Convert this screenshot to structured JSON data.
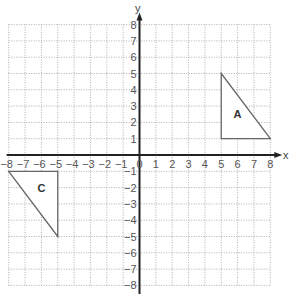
{
  "diagram": {
    "type": "coordinate-plane",
    "x_axis": {
      "label": "x",
      "min": -8,
      "max": 8,
      "ticks": [
        -8,
        -7,
        -6,
        -5,
        -4,
        -3,
        -2,
        -1,
        0,
        1,
        2,
        3,
        4,
        5,
        6,
        7,
        8
      ]
    },
    "y_axis": {
      "label": "y",
      "min": -8,
      "max": 8,
      "ticks": [
        -8,
        -7,
        -6,
        -5,
        -4,
        -3,
        -2,
        -1,
        1,
        2,
        3,
        4,
        5,
        6,
        7,
        8
      ]
    },
    "origin_label": "0",
    "grid": {
      "style": "dotted",
      "step": 1
    },
    "shapes": [
      {
        "label": "A",
        "type": "triangle",
        "vertices": [
          [
            5,
            5
          ],
          [
            5,
            1
          ],
          [
            8,
            1
          ]
        ],
        "label_pos": [
          6,
          2.5
        ]
      },
      {
        "label": "C",
        "type": "triangle",
        "vertices": [
          [
            -8,
            -1
          ],
          [
            -5,
            -1
          ],
          [
            -5,
            -5
          ]
        ],
        "label_pos": [
          -6,
          -2
        ]
      }
    ],
    "colors": {
      "axis": "#222222",
      "grid": "#9a9a9a",
      "shape_stroke": "#666666",
      "text": "#555555"
    }
  }
}
